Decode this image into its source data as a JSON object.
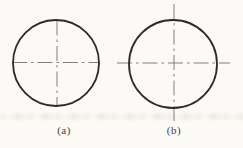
{
  "figure": {
    "background_color": "#fbfaf6",
    "colors": {
      "circle_outline": "#2b2b2b",
      "centerline": "#7e7e7e",
      "label_text": "#4a443c"
    },
    "panels": [
      {
        "label": "(a)",
        "circle": {
          "cx": 56,
          "cy": 63,
          "r": 43
        },
        "horizontal_centerline": {
          "x1": 12,
          "y1": 62.5,
          "x2": 99,
          "y2": 62.5
        },
        "vertical_centerline": {
          "x1": 57,
          "y1": 20.5,
          "x2": 57,
          "y2": 106.5
        }
      },
      {
        "label": "(b)",
        "circle": {
          "cx": 173,
          "cy": 64,
          "r": 44
        },
        "horizontal_centerline": {
          "x1": 117,
          "y1": 63,
          "x2": 230,
          "y2": 63
        },
        "vertical_centerline": {
          "x1": 174,
          "y1": 4,
          "x2": 174,
          "y2": 121
        }
      }
    ]
  }
}
